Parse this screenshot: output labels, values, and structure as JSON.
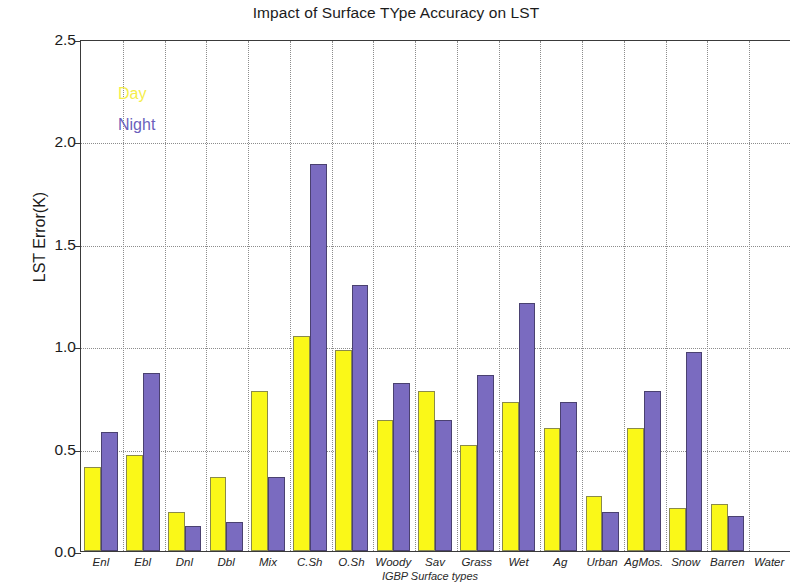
{
  "chart_data": {
    "type": "bar",
    "title": "Impact of Surface TYpe Accuracy on LST",
    "xlabel": "IGBP Surface types",
    "ylabel": "LST Error(K)",
    "ylim": [
      0.0,
      2.5
    ],
    "yticks": [
      "0.0",
      "0.5",
      "1.0",
      "1.5",
      "2.0",
      "2.5"
    ],
    "ytick_values": [
      0.0,
      0.5,
      1.0,
      1.5,
      2.0,
      2.5
    ],
    "grid": true,
    "legend_position": "upper-left-inside",
    "categories": [
      "Enl",
      "Ebl",
      "Dnl",
      "Dbl",
      "Mix",
      "C.Sh",
      "O.Sh",
      "Woody",
      "Sav",
      "Grass",
      "Wet",
      "Ag",
      "Urban",
      "AgMos.",
      "Snow",
      "Barren",
      "Water"
    ],
    "series": [
      {
        "name": "Day",
        "color": "#FAF818",
        "values": [
          0.41,
          0.47,
          0.19,
          0.36,
          0.78,
          1.05,
          0.98,
          0.64,
          0.78,
          0.52,
          0.73,
          0.6,
          0.27,
          0.6,
          0.21,
          0.23,
          0.0
        ]
      },
      {
        "name": "Night",
        "color": "#7A6BC0",
        "values": [
          0.58,
          0.87,
          0.12,
          0.14,
          0.36,
          1.89,
          1.3,
          0.82,
          0.64,
          0.86,
          1.21,
          0.73,
          0.19,
          0.78,
          0.97,
          0.17,
          0.0
        ]
      }
    ]
  },
  "legend": {
    "day_label": "Day",
    "night_label": "Night"
  }
}
